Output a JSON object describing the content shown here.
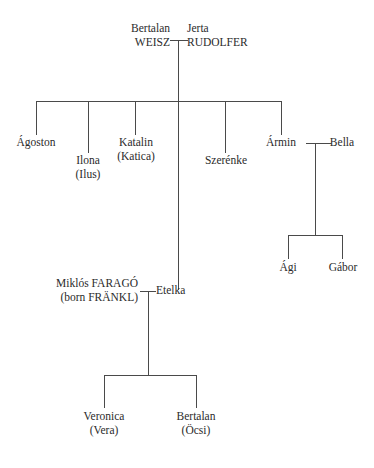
{
  "diagram": {
    "background_color": "#ffffff",
    "line_color": "#4a4a4a",
    "text_color": "#2b2b2b"
  },
  "people": {
    "father": {
      "line1": "Bertalan",
      "line2": "WEISZ"
    },
    "mother": {
      "line1": "Jerta",
      "line2": "RUDOLFER"
    },
    "child1": {
      "line1": "Ágoston",
      "line2": ""
    },
    "child2": {
      "line1": "Ilona",
      "line2": "(Ilus)"
    },
    "child3": {
      "line1": "Katalin",
      "line2": "(Katica)"
    },
    "child4": {
      "line1": "Szerénke",
      "line2": ""
    },
    "child5": {
      "line1": "Ármin",
      "line2": ""
    },
    "child5_spouse": {
      "line1": "Bella",
      "line2": ""
    },
    "grandchild1": {
      "line1": "Ági",
      "line2": ""
    },
    "grandchild2": {
      "line1": "Gábor",
      "line2": ""
    },
    "etelka": {
      "line1": "Etelka",
      "line2": ""
    },
    "etelka_spouse": {
      "line1": "Miklós FARAGÓ",
      "line2": "(born FRÄNKL)"
    },
    "etelka_child1": {
      "line1": "Veronica",
      "line2": "(Vera)"
    },
    "etelka_child2": {
      "line1": "Bertalan",
      "line2": "(Öcsi)"
    }
  }
}
